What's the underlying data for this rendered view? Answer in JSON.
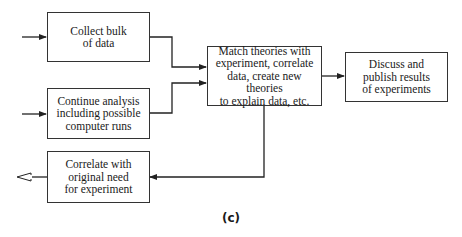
{
  "diagram": {
    "nodes": [
      {
        "id": "collect",
        "label": "Collect bulk\nof data"
      },
      {
        "id": "continue",
        "label": "Continue analysis\nincluding possible\ncomputer runs"
      },
      {
        "id": "match",
        "label": "Match theories with\nexperiment, correlate\ndata, create new theories\nto explain data, etc."
      },
      {
        "id": "discuss",
        "label": "Discuss and\npublish results\nof experiments"
      },
      {
        "id": "correlate",
        "label": "Correlate with\noriginal need\nfor experiment"
      }
    ],
    "edges": [
      {
        "from": "external-input",
        "to": "collect"
      },
      {
        "from": "external-input",
        "to": "continue"
      },
      {
        "from": "collect",
        "to": "match"
      },
      {
        "from": "continue",
        "to": "match"
      },
      {
        "from": "match",
        "to": "discuss"
      },
      {
        "from": "match",
        "to": "correlate"
      },
      {
        "from": "correlate",
        "to": "external-output",
        "style": "hollow-arrow"
      }
    ],
    "caption": "(c)"
  }
}
